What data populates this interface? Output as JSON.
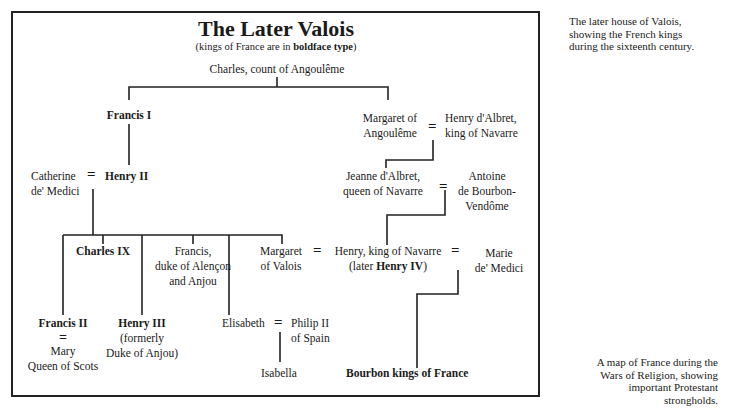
{
  "diagram": {
    "title": "The Later Valois",
    "subtitle_prefix": "(kings of France are in ",
    "subtitle_bold": "boldface type",
    "subtitle_suffix": ")",
    "nodes": {
      "charles_angouleme": "Charles, count of Angoulême",
      "francis_i": "Francis I",
      "margaret_angouleme_1": "Margaret of",
      "margaret_angouleme_2": "Angoulême",
      "henry_albret_1": "Henry d'Albret,",
      "henry_albret_2": "king of Navarre",
      "catherine_1": "Catherine",
      "catherine_2": "de' Medici",
      "henry_ii": "Henry II",
      "jeanne_1": "Jeanne d'Albret,",
      "jeanne_2": "queen of Navarre",
      "antoine_1": "Antoine",
      "antoine_2": "de Bourbon-",
      "antoine_3": "Vendôme",
      "charles_ix": "Charles IX",
      "francis_alencon_1": "Francis,",
      "francis_alencon_2": "duke of Alençon",
      "francis_alencon_3": "and Anjou",
      "margaret_valois_1": "Margaret",
      "margaret_valois_2": "of Valois",
      "henry_navarre_1": "Henry, king of Navarre",
      "henry_navarre_2_prefix": "(later ",
      "henry_navarre_2_bold": "Henry IV",
      "henry_navarre_2_suffix": ")",
      "marie_1": "Marie",
      "marie_2": "de' Medici",
      "francis_ii": "Francis II",
      "mary_1": "Mary",
      "mary_2": "Queen of Scots",
      "henry_iii": "Henry III",
      "henry_iii_2": "(formerly",
      "henry_iii_3": "Duke of Anjou)",
      "elisabeth": "Elisabeth",
      "philip_1": "Philip II",
      "philip_2": "of Spain",
      "isabella": "Isabella",
      "bourbon_kings": "Bourbon kings of France"
    },
    "marriage_symbol": "="
  },
  "captions": {
    "top": [
      "The later house of Valois,",
      "showing the French kings",
      "during the sixteenth century."
    ],
    "bottom": [
      "A map of France during the",
      "Wars of Religion, showing",
      "important Protestant",
      "strongholds."
    ]
  }
}
